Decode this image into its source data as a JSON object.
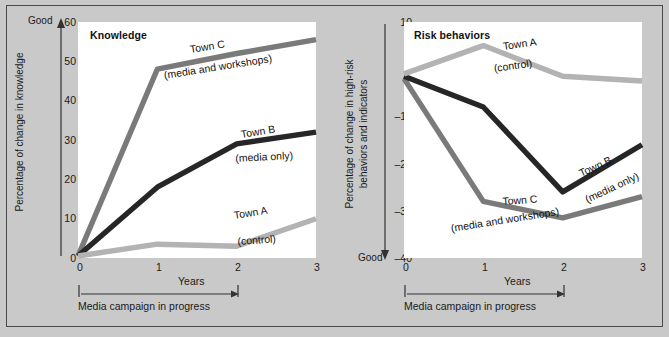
{
  "figure": {
    "background_color": "#c9c9c9",
    "frame_color": "#4a4a4a",
    "plot_background": "#ffffff"
  },
  "series_colors": {
    "town_a": "#b3b3b3",
    "town_b": "#262626",
    "town_c": "#7a7a7a"
  },
  "panels": [
    {
      "id": "knowledge",
      "title": "Knowledge",
      "ylabel": "Percentage of change in knowledge",
      "ylabel_lines": [
        "Percentage of change in knowledge"
      ],
      "xlabel": "Years",
      "good_label": "Good",
      "good_arrow_direction": "up",
      "campaign_label": "Media campaign in progress",
      "yticks": [
        "60",
        "50",
        "40",
        "30",
        "20",
        "10",
        "0"
      ],
      "xticks": [
        "0",
        "1",
        "2",
        "3"
      ],
      "annotations": [
        {
          "name": "town-c",
          "line1": "Town C",
          "line2": "(media and workshops)"
        },
        {
          "name": "town-b",
          "line1": "Town B",
          "line2": "(media only)"
        },
        {
          "name": "town-a",
          "line1": "Town A",
          "line2": "(control)"
        }
      ]
    },
    {
      "id": "risk-behaviors",
      "title": "Risk behaviors",
      "ylabel": "Percentage of change in high-risk behaviors and indicators",
      "ylabel_lines": [
        "Percentage of change in high-risk",
        "behaviors and indicators"
      ],
      "xlabel": "Years",
      "good_label": "Good",
      "good_arrow_direction": "down",
      "campaign_label": "Media campaign in progress",
      "yticks": [
        "10",
        "0",
        "–10",
        "–20",
        "–30",
        "–40"
      ],
      "xticks": [
        "0",
        "1",
        "2",
        "3"
      ],
      "annotations": [
        {
          "name": "town-a",
          "line1": "Town A",
          "line2": "(control)"
        },
        {
          "name": "town-b",
          "line1": "Town B",
          "line2": "(media only)"
        },
        {
          "name": "town-c",
          "line1": "Town C",
          "line2": "(media and workshops)"
        }
      ]
    }
  ],
  "chart_data": [
    {
      "type": "line",
      "title": "Knowledge",
      "xlabel": "Years",
      "ylabel": "Percentage of change in knowledge",
      "x": [
        0,
        1,
        2,
        3
      ],
      "xlim": [
        0,
        3
      ],
      "ylim": [
        0,
        60
      ],
      "yticks": [
        0,
        10,
        20,
        30,
        40,
        50,
        60
      ],
      "xticks": [
        0,
        1,
        2,
        3
      ],
      "grid": false,
      "legend": "inline-annotations",
      "axis_direction_note": "Good = up",
      "series": [
        {
          "name": "Town A (control)",
          "label": "Town A",
          "sublabel": "(control)",
          "color": "#b3b3b3",
          "values": [
            0.5,
            3.5,
            3,
            10
          ]
        },
        {
          "name": "Town B (media only)",
          "label": "Town B",
          "sublabel": "(media only)",
          "color": "#262626",
          "values": [
            0.5,
            18,
            29,
            32
          ]
        },
        {
          "name": "Town C (media and workshops)",
          "label": "Town C",
          "sublabel": "(media and workshops)",
          "color": "#7a7a7a",
          "values": [
            0.5,
            48,
            52,
            55.5
          ]
        }
      ],
      "annotations": [
        "Media campaign in progress (year 0 to year 2)"
      ]
    },
    {
      "type": "line",
      "title": "Risk behaviors",
      "xlabel": "Years",
      "ylabel": "Percentage of change in high-risk behaviors and indicators",
      "x": [
        0,
        1,
        2,
        3
      ],
      "xlim": [
        0,
        3
      ],
      "ylim": [
        -40,
        10
      ],
      "yticks": [
        -40,
        -30,
        -20,
        -10,
        0,
        10
      ],
      "xticks": [
        0,
        1,
        2,
        3
      ],
      "grid": false,
      "legend": "inline-annotations",
      "axis_direction_note": "Good = down",
      "series": [
        {
          "name": "Town A (control)",
          "label": "Town A",
          "sublabel": "(control)",
          "color": "#b3b3b3",
          "values": [
            -1,
            5,
            -1.5,
            -2.5
          ]
        },
        {
          "name": "Town B (media only)",
          "label": "Town B",
          "sublabel": "(media only)",
          "color": "#262626",
          "values": [
            -1.5,
            -8,
            -26,
            -16
          ]
        },
        {
          "name": "Town C (media and workshops)",
          "label": "Town C",
          "sublabel": "(media and workshops)",
          "color": "#7a7a7a",
          "values": [
            -2,
            -28,
            -31.5,
            -27
          ]
        }
      ],
      "annotations": [
        "Media campaign in progress (year 0 to year 2)"
      ]
    }
  ]
}
